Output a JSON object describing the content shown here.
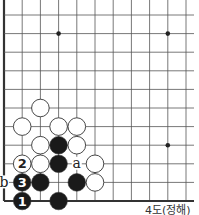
{
  "diagram": {
    "type": "go-board-fragment",
    "caption": "4도(정해)",
    "grid": {
      "origin_x": 4,
      "origin_y": 15,
      "spacing_x": 18.2,
      "spacing_y": 18.6,
      "cols": 11,
      "rows": 11,
      "left_edge": true,
      "bottom_edge": true,
      "top_edge": false,
      "right_edge": false,
      "line_color": "#555555",
      "edge_color": "#333333"
    },
    "star_points": [
      {
        "col": 3,
        "row": 1
      },
      {
        "col": 9,
        "row": 1
      },
      {
        "col": 9,
        "row": 7
      }
    ],
    "stones": [
      {
        "color": "white",
        "col": 2,
        "row": 5,
        "label": ""
      },
      {
        "color": "white",
        "col": 1,
        "row": 6,
        "label": ""
      },
      {
        "color": "white",
        "col": 3,
        "row": 6,
        "label": ""
      },
      {
        "color": "white",
        "col": 4,
        "row": 6,
        "label": ""
      },
      {
        "color": "white",
        "col": 2,
        "row": 7,
        "label": ""
      },
      {
        "color": "black",
        "col": 3,
        "row": 7,
        "label": ""
      },
      {
        "color": "white",
        "col": 4,
        "row": 7,
        "label": ""
      },
      {
        "color": "white",
        "col": 1,
        "row": 8,
        "label": "2"
      },
      {
        "color": "white",
        "col": 2,
        "row": 8,
        "label": ""
      },
      {
        "color": "black",
        "col": 3,
        "row": 8,
        "label": ""
      },
      {
        "color": "white",
        "col": 5,
        "row": 8,
        "label": ""
      },
      {
        "color": "black",
        "col": 1,
        "row": 9,
        "label": "3"
      },
      {
        "color": "black",
        "col": 2,
        "row": 9,
        "label": ""
      },
      {
        "color": "black",
        "col": 4,
        "row": 9,
        "label": ""
      },
      {
        "color": "white",
        "col": 5,
        "row": 9,
        "label": ""
      },
      {
        "color": "black",
        "col": 1,
        "row": 10,
        "label": "1"
      },
      {
        "color": "black",
        "col": 3,
        "row": 10,
        "label": ""
      }
    ],
    "markers": [
      {
        "text": "a",
        "col": 4,
        "row": 8
      },
      {
        "text": "b",
        "col": 0,
        "row": 9
      }
    ],
    "colors": {
      "black_stone": "#1a1a1a",
      "white_stone": "#ffffff",
      "stone_outline": "#333333",
      "label_on_black": "#ffffff",
      "label_on_white": "#222222"
    }
  }
}
